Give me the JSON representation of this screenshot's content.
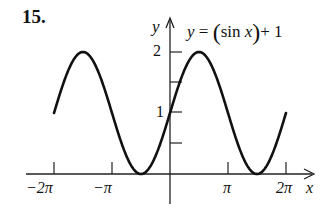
{
  "problem_number": "15.",
  "equation": {
    "lhs": "y",
    "eq": " = ",
    "open": "(",
    "fn": "sin ",
    "var": "x",
    "close": ")",
    "tail": "+ 1"
  },
  "axes": {
    "x_label": "x",
    "y_label": "y"
  },
  "x_tick_labels": [
    "−2π",
    "−π",
    "π",
    "2π"
  ],
  "y_tick_labels": [
    "1",
    "2"
  ],
  "chart_data": {
    "type": "line",
    "xlabel": "x",
    "ylabel": "y",
    "xlim": [
      -6.28319,
      6.28319
    ],
    "ylim": [
      0,
      2
    ],
    "x_ticks": [
      -6.28319,
      -3.14159,
      3.14159,
      6.28319
    ],
    "x_tick_labels": [
      "-2π",
      "-π",
      "π",
      "2π"
    ],
    "y_ticks": [
      0.5,
      1,
      1.5,
      2
    ],
    "y_tick_labels": [
      "",
      "1",
      "",
      "2"
    ],
    "grid": false,
    "series": [
      {
        "name": "y = sin(x) + 1",
        "x": [
          -6.28319,
          -4.71239,
          -3.14159,
          -1.5708,
          0,
          1.5708,
          3.14159,
          4.71239,
          6.28319
        ],
        "values": [
          1,
          2,
          1,
          0,
          1,
          2,
          1,
          0,
          1
        ]
      }
    ]
  }
}
